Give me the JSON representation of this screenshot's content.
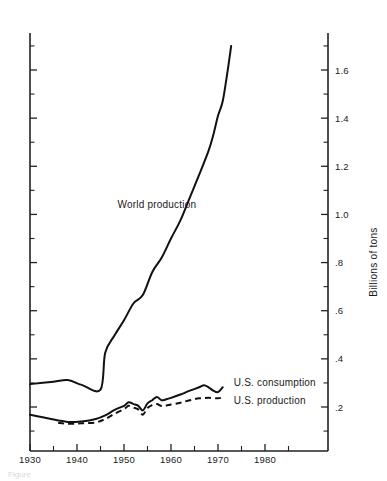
{
  "figure": {
    "caption": "Figure"
  },
  "chart_data": {
    "type": "line",
    "title": "",
    "xlabel": "",
    "ylabel": "Billions of tons",
    "xlim": [
      1930,
      1985
    ],
    "ylim": [
      0.0,
      1.8
    ],
    "xticks": [
      1930,
      1940,
      1950,
      1960,
      1970,
      1980
    ],
    "xtick_labels": [
      "1930",
      "1940",
      "1950",
      "1960",
      "1970",
      "1980"
    ],
    "xminor_step": 5,
    "yticks": [
      0.2,
      0.4,
      0.6,
      0.8,
      1.0,
      1.2,
      1.4,
      1.6
    ],
    "ytick_labels": [
      ".2",
      ".4",
      ".6",
      ".8",
      "1.0",
      "1.2",
      "1.4",
      "1.6"
    ],
    "yminor_step": 0.1,
    "y_axis_side": "right",
    "grid": false,
    "legend": "inline-annotations",
    "series": [
      {
        "name": "World production",
        "style": "solid",
        "label_x": 1957,
        "label_y": 1.04,
        "points": [
          [
            1930,
            0.295
          ],
          [
            1935,
            0.305
          ],
          [
            1938,
            0.312
          ],
          [
            1941,
            0.292
          ],
          [
            1945,
            0.272
          ],
          [
            1946,
            0.425
          ],
          [
            1948,
            0.498
          ],
          [
            1950,
            0.56
          ],
          [
            1952,
            0.63
          ],
          [
            1954,
            0.665
          ],
          [
            1956,
            0.76
          ],
          [
            1958,
            0.82
          ],
          [
            1960,
            0.9
          ],
          [
            1962,
            0.975
          ],
          [
            1964,
            1.07
          ],
          [
            1966,
            1.165
          ],
          [
            1968,
            1.265
          ],
          [
            1969,
            1.33
          ],
          [
            1970,
            1.41
          ],
          [
            1971,
            1.47
          ],
          [
            1972,
            1.59
          ],
          [
            1972.8,
            1.7
          ]
        ]
      },
      {
        "name": "U.S. consumption",
        "style": "solid",
        "label_x": 1972.5,
        "label_y": 0.3,
        "points": [
          [
            1930,
            0.168
          ],
          [
            1934,
            0.152
          ],
          [
            1938,
            0.138
          ],
          [
            1941,
            0.14
          ],
          [
            1944,
            0.15
          ],
          [
            1946,
            0.165
          ],
          [
            1948,
            0.188
          ],
          [
            1950,
            0.205
          ],
          [
            1951,
            0.22
          ],
          [
            1952,
            0.212
          ],
          [
            1953,
            0.206
          ],
          [
            1954,
            0.186
          ],
          [
            1955,
            0.215
          ],
          [
            1956,
            0.228
          ],
          [
            1957,
            0.242
          ],
          [
            1958,
            0.228
          ],
          [
            1959,
            0.232
          ],
          [
            1960,
            0.238
          ],
          [
            1962,
            0.252
          ],
          [
            1964,
            0.268
          ],
          [
            1966,
            0.282
          ],
          [
            1967,
            0.29
          ],
          [
            1968,
            0.282
          ],
          [
            1969,
            0.268
          ],
          [
            1970,
            0.262
          ],
          [
            1971,
            0.282
          ]
        ]
      },
      {
        "name": "U.S. production",
        "style": "dashed",
        "label_x": 1972.5,
        "label_y": 0.228,
        "points": [
          [
            1936,
            0.134
          ],
          [
            1938,
            0.13
          ],
          [
            1941,
            0.132
          ],
          [
            1944,
            0.136
          ],
          [
            1946,
            0.15
          ],
          [
            1948,
            0.172
          ],
          [
            1950,
            0.192
          ],
          [
            1951,
            0.205
          ],
          [
            1952,
            0.198
          ],
          [
            1953,
            0.19
          ],
          [
            1954,
            0.168
          ],
          [
            1955,
            0.196
          ],
          [
            1956,
            0.208
          ],
          [
            1957,
            0.212
          ],
          [
            1958,
            0.204
          ],
          [
            1959,
            0.206
          ],
          [
            1960,
            0.21
          ],
          [
            1962,
            0.218
          ],
          [
            1964,
            0.228
          ],
          [
            1966,
            0.236
          ],
          [
            1968,
            0.238
          ],
          [
            1970,
            0.236
          ],
          [
            1971,
            0.24
          ]
        ]
      }
    ]
  }
}
